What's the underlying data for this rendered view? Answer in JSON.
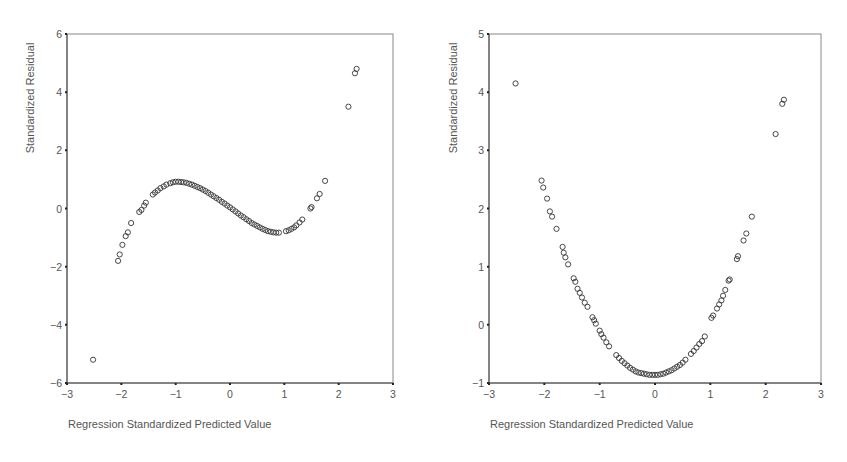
{
  "chart_data": [
    {
      "type": "scatter",
      "title": "",
      "xlabel": "Regression Standardized Predicted Value",
      "ylabel": "Standardized Residual",
      "xlim": [
        -3,
        3
      ],
      "ylim": [
        -6,
        6
      ],
      "xticks": [
        -3,
        -2,
        -1,
        0,
        1,
        2,
        3
      ],
      "yticks": [
        -6,
        -4,
        -2,
        0,
        2,
        4,
        6
      ],
      "grid": false,
      "legend": null,
      "points": [
        [
          -2.52,
          -5.2
        ],
        [
          -2.06,
          -1.8
        ],
        [
          -2.03,
          -1.58
        ],
        [
          -1.98,
          -1.25
        ],
        [
          -1.92,
          -0.95
        ],
        [
          -1.88,
          -0.82
        ],
        [
          -1.82,
          -0.5
        ],
        [
          -1.67,
          -0.12
        ],
        [
          -1.63,
          -0.05
        ],
        [
          -1.58,
          0.1
        ],
        [
          -1.55,
          0.2
        ],
        [
          -1.42,
          0.48
        ],
        [
          -1.38,
          0.55
        ],
        [
          -1.33,
          0.62
        ],
        [
          -1.28,
          0.7
        ],
        [
          -1.22,
          0.76
        ],
        [
          -1.17,
          0.82
        ],
        [
          -1.1,
          0.87
        ],
        [
          -1.05,
          0.9
        ],
        [
          -1.0,
          0.92
        ],
        [
          -0.95,
          0.92
        ],
        [
          -0.9,
          0.91
        ],
        [
          -0.85,
          0.9
        ],
        [
          -0.8,
          0.88
        ],
        [
          -0.75,
          0.85
        ],
        [
          -0.7,
          0.82
        ],
        [
          -0.65,
          0.78
        ],
        [
          -0.6,
          0.74
        ],
        [
          -0.55,
          0.7
        ],
        [
          -0.5,
          0.65
        ],
        [
          -0.45,
          0.6
        ],
        [
          -0.4,
          0.54
        ],
        [
          -0.35,
          0.48
        ],
        [
          -0.3,
          0.42
        ],
        [
          -0.25,
          0.36
        ],
        [
          -0.2,
          0.3
        ],
        [
          -0.15,
          0.23
        ],
        [
          -0.1,
          0.17
        ],
        [
          -0.05,
          0.1
        ],
        [
          0.0,
          0.04
        ],
        [
          0.05,
          -0.03
        ],
        [
          0.1,
          -0.1
        ],
        [
          0.15,
          -0.17
        ],
        [
          0.2,
          -0.24
        ],
        [
          0.25,
          -0.3
        ],
        [
          0.3,
          -0.37
        ],
        [
          0.35,
          -0.43
        ],
        [
          0.4,
          -0.5
        ],
        [
          0.45,
          -0.55
        ],
        [
          0.5,
          -0.6
        ],
        [
          0.55,
          -0.65
        ],
        [
          0.6,
          -0.7
        ],
        [
          0.65,
          -0.74
        ],
        [
          0.7,
          -0.78
        ],
        [
          0.75,
          -0.8
        ],
        [
          0.8,
          -0.82
        ],
        [
          0.85,
          -0.83
        ],
        [
          0.9,
          -0.83
        ],
        [
          1.03,
          -0.78
        ],
        [
          1.08,
          -0.75
        ],
        [
          1.13,
          -0.7
        ],
        [
          1.18,
          -0.65
        ],
        [
          1.22,
          -0.58
        ],
        [
          1.28,
          -0.48
        ],
        [
          1.33,
          -0.38
        ],
        [
          1.48,
          0.0
        ],
        [
          1.5,
          0.05
        ],
        [
          1.6,
          0.35
        ],
        [
          1.65,
          0.5
        ],
        [
          1.75,
          0.95
        ],
        [
          2.18,
          3.5
        ],
        [
          2.3,
          4.65
        ],
        [
          2.33,
          4.8
        ]
      ]
    },
    {
      "type": "scatter",
      "title": "",
      "xlabel": "Regression Standardized Predicted Value",
      "ylabel": "Standardized Residual",
      "xlim": [
        -3,
        3
      ],
      "ylim": [
        -1,
        5
      ],
      "xticks": [
        -3,
        -2,
        -1,
        0,
        1,
        2,
        3
      ],
      "yticks": [
        -1,
        0,
        1,
        2,
        3,
        4,
        5
      ],
      "grid": false,
      "legend": null,
      "points": [
        [
          -2.52,
          4.15
        ],
        [
          -2.05,
          2.48
        ],
        [
          -2.02,
          2.36
        ],
        [
          -1.95,
          2.17
        ],
        [
          -1.9,
          1.95
        ],
        [
          -1.86,
          1.86
        ],
        [
          -1.78,
          1.65
        ],
        [
          -1.67,
          1.34
        ],
        [
          -1.65,
          1.24
        ],
        [
          -1.62,
          1.16
        ],
        [
          -1.57,
          1.04
        ],
        [
          -1.47,
          0.8
        ],
        [
          -1.44,
          0.74
        ],
        [
          -1.4,
          0.62
        ],
        [
          -1.36,
          0.55
        ],
        [
          -1.32,
          0.47
        ],
        [
          -1.27,
          0.38
        ],
        [
          -1.22,
          0.31
        ],
        [
          -1.13,
          0.13
        ],
        [
          -1.1,
          0.08
        ],
        [
          -1.07,
          0.02
        ],
        [
          -1.0,
          -0.1
        ],
        [
          -0.97,
          -0.16
        ],
        [
          -0.93,
          -0.22
        ],
        [
          -0.88,
          -0.3
        ],
        [
          -0.83,
          -0.37
        ],
        [
          -0.7,
          -0.52
        ],
        [
          -0.65,
          -0.57
        ],
        [
          -0.6,
          -0.62
        ],
        [
          -0.55,
          -0.66
        ],
        [
          -0.5,
          -0.7
        ],
        [
          -0.45,
          -0.74
        ],
        [
          -0.4,
          -0.77
        ],
        [
          -0.35,
          -0.8
        ],
        [
          -0.3,
          -0.82
        ],
        [
          -0.25,
          -0.83
        ],
        [
          -0.2,
          -0.84
        ],
        [
          -0.15,
          -0.85
        ],
        [
          -0.1,
          -0.86
        ],
        [
          -0.05,
          -0.86
        ],
        [
          0.0,
          -0.86
        ],
        [
          0.05,
          -0.86
        ],
        [
          0.1,
          -0.85
        ],
        [
          0.15,
          -0.84
        ],
        [
          0.2,
          -0.82
        ],
        [
          0.25,
          -0.8
        ],
        [
          0.3,
          -0.78
        ],
        [
          0.35,
          -0.75
        ],
        [
          0.4,
          -0.72
        ],
        [
          0.45,
          -0.69
        ],
        [
          0.5,
          -0.65
        ],
        [
          0.55,
          -0.6
        ],
        [
          0.65,
          -0.5
        ],
        [
          0.7,
          -0.45
        ],
        [
          0.75,
          -0.39
        ],
        [
          0.8,
          -0.33
        ],
        [
          0.85,
          -0.28
        ],
        [
          0.9,
          -0.2
        ],
        [
          1.02,
          0.12
        ],
        [
          1.05,
          0.16
        ],
        [
          1.12,
          0.28
        ],
        [
          1.16,
          0.35
        ],
        [
          1.2,
          0.42
        ],
        [
          1.23,
          0.5
        ],
        [
          1.27,
          0.6
        ],
        [
          1.33,
          0.76
        ],
        [
          1.35,
          0.78
        ],
        [
          1.48,
          1.13
        ],
        [
          1.5,
          1.18
        ],
        [
          1.6,
          1.45
        ],
        [
          1.65,
          1.57
        ],
        [
          1.75,
          1.86
        ],
        [
          2.18,
          3.28
        ],
        [
          2.3,
          3.8
        ],
        [
          2.33,
          3.87
        ]
      ]
    }
  ],
  "panels": [
    {
      "ylabel": "Standardized Residual",
      "xlabel": "Regression Standardized Predicted Value",
      "xtick_labels": [
        "-3",
        "-2",
        "-1",
        "0",
        "1",
        "2",
        "3"
      ],
      "ytick_labels": [
        "6",
        "4",
        "2",
        "0",
        "-2",
        "-4",
        "-6"
      ]
    },
    {
      "ylabel": "Standardized Residual",
      "xlabel": "Regression Standardized Predicted Value",
      "xtick_labels": [
        "-3",
        "-2",
        "-1",
        "0",
        "1",
        "2",
        "3"
      ],
      "ytick_labels": [
        "5",
        "4",
        "3",
        "2",
        "1",
        "0",
        "-1"
      ]
    }
  ]
}
